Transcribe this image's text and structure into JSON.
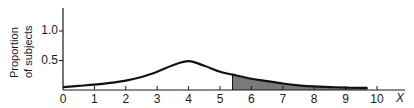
{
  "chart_data": {
    "type": "area",
    "title": "",
    "xlabel": "X",
    "ylabel": "Proportion of subjects",
    "ylabel_lines": [
      "Proportion",
      "of subjects"
    ],
    "xlim": [
      0,
      10.5
    ],
    "ylim": [
      0,
      1.35
    ],
    "x_ticks": [
      0,
      1,
      2,
      3,
      4,
      5,
      6,
      7,
      8,
      9,
      10
    ],
    "x_tick_labels": [
      "0",
      "1",
      "2",
      "3",
      "4",
      "5",
      "6",
      "7",
      "8",
      "9",
      "10"
    ],
    "y_ticks": [
      0.5,
      1.0
    ],
    "y_tick_labels": [
      "0.5",
      "1.0"
    ],
    "grid": false,
    "legend": null,
    "series": [
      {
        "name": "distribution curve",
        "x": [
          0,
          0.5,
          1,
          1.5,
          2,
          2.5,
          3,
          3.5,
          4,
          4.5,
          5,
          5.4,
          6,
          6.5,
          7,
          7.5,
          8,
          8.5,
          9,
          9.5,
          9.7
        ],
        "y": [
          0.05,
          0.07,
          0.09,
          0.12,
          0.16,
          0.22,
          0.31,
          0.42,
          0.49,
          0.41,
          0.31,
          0.26,
          0.19,
          0.15,
          0.11,
          0.08,
          0.06,
          0.05,
          0.04,
          0.035,
          0.035
        ]
      }
    ],
    "shaded_region": {
      "x_start": 5.4,
      "x_end": 9.7,
      "color": "#7a7a7a",
      "description": "area under curve shaded"
    },
    "peak": {
      "x": 4,
      "y": 0.49
    }
  }
}
